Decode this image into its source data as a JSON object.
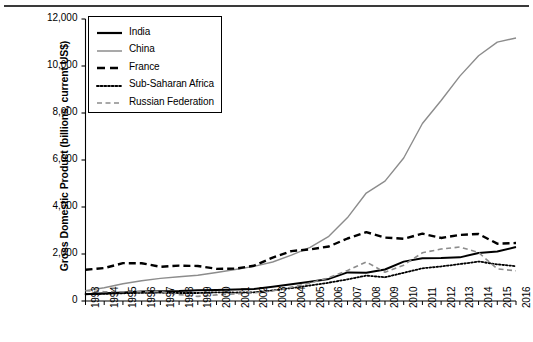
{
  "chart_data": {
    "type": "line",
    "title": "",
    "xlabel": "",
    "ylabel": "Gross Domestic Product (billions, current US$)",
    "x": [
      1993,
      1994,
      1995,
      1996,
      1997,
      1998,
      1999,
      2000,
      2001,
      2002,
      2003,
      2004,
      2005,
      2006,
      2007,
      2008,
      2009,
      2010,
      2011,
      2012,
      2013,
      2014,
      2015,
      2016
    ],
    "xtick_labels": [
      "1993",
      "1994",
      "1995",
      "1996",
      "1997",
      "1998",
      "1999",
      "2000",
      "2001",
      "2002",
      "2003",
      "2004",
      "2005",
      "2006",
      "2007",
      "2008",
      "2009",
      "2010",
      "2011",
      "2012",
      "2013",
      "2014",
      "2015",
      "2016"
    ],
    "ytick_labels": [
      "0",
      "2,000",
      "4,000",
      "6,000",
      "8,000",
      "10,000",
      "12,000"
    ],
    "ytick_values": [
      0,
      2000,
      4000,
      6000,
      8000,
      10000,
      12000
    ],
    "ylim": [
      0,
      12000
    ],
    "grid": false,
    "legend_position": "top-left",
    "series": [
      {
        "name": "India",
        "style": "solid",
        "color": "#000000",
        "width": 2.0,
        "values": [
          284,
          333,
          366,
          400,
          416,
          421,
          459,
          468,
          485,
          515,
          607,
          709,
          820,
          940,
          1217,
          1199,
          1342,
          1676,
          1823,
          1828,
          1857,
          2039,
          2104,
          2294
        ]
      },
      {
        "name": "China",
        "style": "solid",
        "color": "#8c8c8c",
        "width": 1.4,
        "values": [
          444,
          564,
          734,
          863,
          962,
          1029,
          1094,
          1211,
          1339,
          1471,
          1660,
          1955,
          2286,
          2752,
          3550,
          4594,
          5102,
          6087,
          7552,
          8532,
          9570,
          10438,
          11016,
          11191
        ]
      },
      {
        "name": "France",
        "style": "dashed-bold",
        "color": "#000000",
        "width": 2.4,
        "values": [
          1328,
          1400,
          1610,
          1608,
          1455,
          1504,
          1492,
          1368,
          1377,
          1500,
          1848,
          2124,
          2197,
          2319,
          2660,
          2931,
          2700,
          2647,
          2865,
          2683,
          2811,
          2852,
          2439,
          2465
        ]
      },
      {
        "name": "Sub-Saharan Africa",
        "style": "dotted",
        "color": "#000000",
        "width": 1.8,
        "values": [
          295,
          300,
          330,
          345,
          355,
          340,
          340,
          370,
          360,
          370,
          450,
          550,
          660,
          780,
          920,
          1080,
          1010,
          1200,
          1390,
          1470,
          1570,
          1680,
          1560,
          1480
        ]
      },
      {
        "name": "Russian Federation",
        "style": "dashed-thin",
        "color": "#8c8c8c",
        "width": 1.6,
        "values": [
          435,
          395,
          395,
          392,
          404,
          271,
          196,
          260,
          307,
          345,
          430,
          591,
          764,
          990,
          1300,
          1661,
          1223,
          1525,
          2052,
          2210,
          2297,
          2064,
          1366,
          1285
        ]
      }
    ]
  },
  "legend": {
    "items": [
      {
        "label": "India",
        "swatch": "solid-black-thick"
      },
      {
        "label": "China",
        "swatch": "solid-gray-thin"
      },
      {
        "label": "France",
        "swatch": "dashed-black-bold"
      },
      {
        "label": "Sub-Saharan Africa",
        "swatch": "dotted-black"
      },
      {
        "label": "Russian Federation",
        "swatch": "dashed-gray-thin"
      }
    ]
  },
  "axes": {
    "y_title": "Gross Domestic Product (billions, current US$)"
  }
}
